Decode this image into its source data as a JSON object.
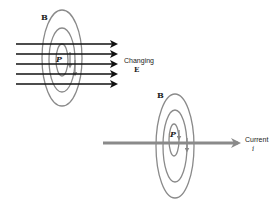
{
  "diagram1": {
    "field_label": "B",
    "point_label": "P",
    "arrow_label_line1": "Changing",
    "arrow_label_line2": "E",
    "colors": {
      "arrows": "#111111",
      "rings": "#888888"
    }
  },
  "diagram2": {
    "field_label": "B",
    "point_label": "P",
    "arrow_label_line1": "Current",
    "arrow_label_line2": "i",
    "colors": {
      "wire": "#8a8a8a",
      "rings": "#888888"
    }
  }
}
